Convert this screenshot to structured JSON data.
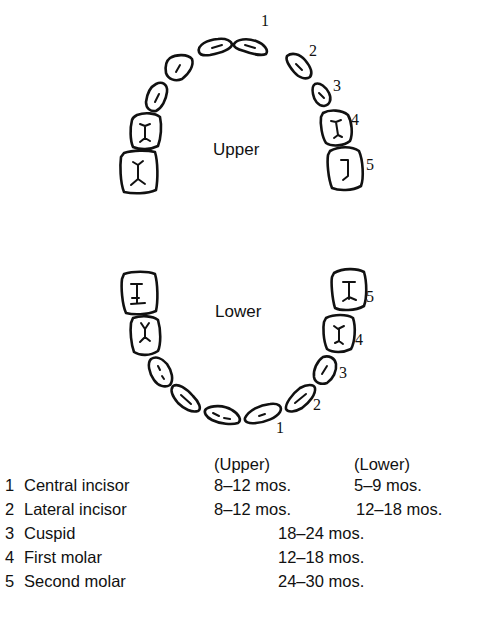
{
  "diagram": {
    "upper_label": "Upper",
    "lower_label": "Lower",
    "tooth_numbers": {
      "upper": [
        "1",
        "2",
        "3",
        "4",
        "5"
      ],
      "lower": [
        "1",
        "2",
        "3",
        "4",
        "5"
      ]
    }
  },
  "legend": {
    "headers": {
      "upper": "(Upper)",
      "lower": "(Lower)"
    },
    "rows": [
      {
        "num": "1",
        "name": "Central incisor",
        "upper": "8–12 mos.",
        "lower": "5–9 mos.",
        "combined": ""
      },
      {
        "num": "2",
        "name": "Lateral incisor",
        "upper": "8–12 mos.",
        "lower": "12–18 mos.",
        "combined": ""
      },
      {
        "num": "3",
        "name": "Cuspid",
        "upper": "",
        "lower": "",
        "combined": "18–24 mos."
      },
      {
        "num": "4",
        "name": "First molar",
        "upper": "",
        "lower": "",
        "combined": "12–18 mos."
      },
      {
        "num": "5",
        "name": "Second molar",
        "upper": "",
        "lower": "",
        "combined": "24–30 mos."
      }
    ]
  }
}
